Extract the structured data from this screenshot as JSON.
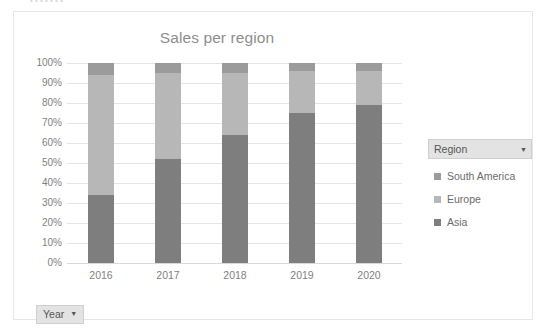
{
  "window": {
    "ghost_text_above": "• • • • • • •"
  },
  "chart": {
    "title": "Sales per region"
  },
  "legend_field": {
    "header_label": "Region",
    "caret_icon": "chevron-down-icon",
    "items": [
      {
        "label": "South America",
        "color": "#9b9b9b"
      },
      {
        "label": "Europe",
        "color": "#b7b7b7"
      },
      {
        "label": "Asia",
        "color": "#7e7e7e"
      }
    ]
  },
  "axis_field": {
    "label": "Year",
    "caret_icon": "chevron-down-icon"
  },
  "chart_data": {
    "type": "bar",
    "title": "Sales per region",
    "xlabel": "",
    "ylabel": "",
    "stacked": true,
    "stack_mode": "100%",
    "orientation": "vertical",
    "grid": true,
    "legend_position": "right",
    "ylim": [
      0,
      100
    ],
    "ytick_labels": [
      "0%",
      "10%",
      "20%",
      "30%",
      "40%",
      "50%",
      "60%",
      "70%",
      "80%",
      "90%",
      "100%"
    ],
    "ytick_values": [
      0,
      10,
      20,
      30,
      40,
      50,
      60,
      70,
      80,
      90,
      100
    ],
    "categories": [
      "2016",
      "2017",
      "2018",
      "2019",
      "2020"
    ],
    "series": [
      {
        "name": "Asia",
        "color": "#7e7e7e",
        "values": [
          34,
          52,
          64,
          75,
          79
        ]
      },
      {
        "name": "Europe",
        "color": "#b7b7b7",
        "values": [
          60,
          43,
          31,
          21,
          17
        ]
      },
      {
        "name": "South America",
        "color": "#9b9b9b",
        "values": [
          6,
          5,
          5,
          4,
          4
        ]
      }
    ]
  }
}
